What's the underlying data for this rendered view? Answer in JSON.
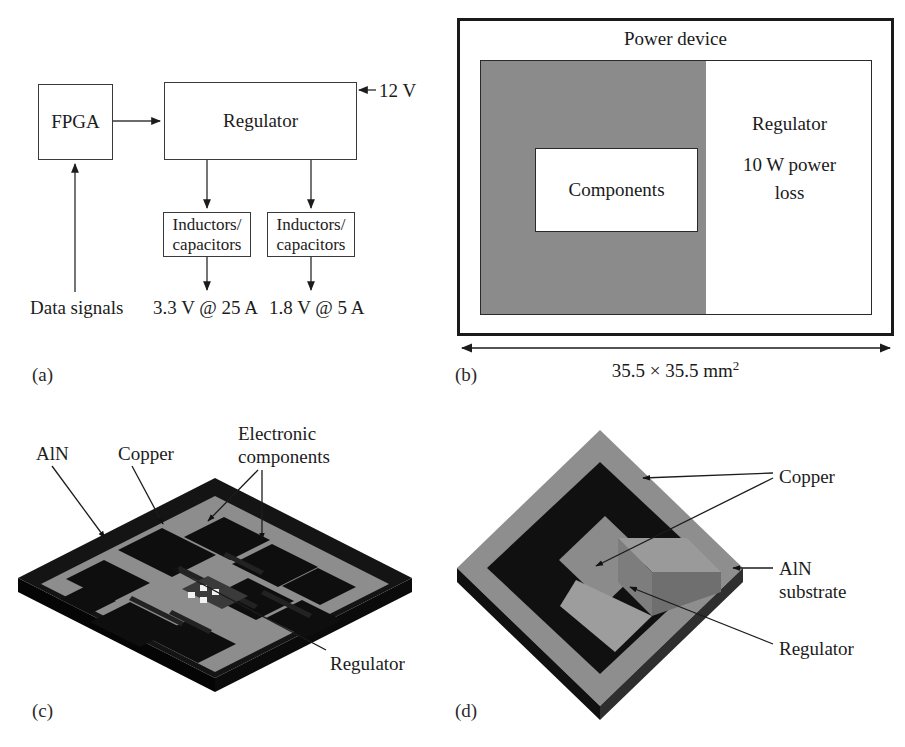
{
  "figure": {
    "panels": [
      {
        "tag": "(a)",
        "name": "block-diagram"
      },
      {
        "tag": "(b)",
        "name": "floorplan"
      },
      {
        "tag": "(c)",
        "name": "pcb-isometric"
      },
      {
        "tag": "(d)",
        "name": "substrate-isometric"
      }
    ]
  },
  "panel_a": {
    "tag": "(a)",
    "blocks": {
      "fpga": "FPGA",
      "regulator": "Regulator",
      "inductors_left": "Inductors/\ncapacitors",
      "inductors_right": "Inductors/\ncapacitors"
    },
    "block_lines": {
      "inductors_line1": "Inductors/",
      "inductors_line2": "capacitors"
    },
    "labels": {
      "input_voltage": "12 V",
      "data_signals": "Data signals",
      "output_left": "3.3 V @ 25 A",
      "output_right": "1.8 V @ 5 A"
    }
  },
  "panel_b": {
    "tag": "(b)",
    "title": "Power device",
    "components": "Components",
    "regulator_line1": "Regulator",
    "regulator_line2": "10 W power",
    "regulator_line3": "loss",
    "dimension_prefix": "35.5 × 35.5 mm",
    "dimension_exponent": "2",
    "gray_fill": "#8b8b8b"
  },
  "panel_c": {
    "tag": "(c)",
    "labels": {
      "aln": "AlN",
      "copper": "Copper",
      "electronic_components_line1": "Electronic",
      "electronic_components_line2": "components",
      "regulator": "Regulator"
    },
    "colors": {
      "board_dark": "#141414",
      "copper": "#8d8d8d",
      "pad_black": "#0d0d0d",
      "edge": "#2b2b2b"
    }
  },
  "panel_d": {
    "tag": "(d)",
    "labels": {
      "copper": "Copper",
      "aln_line1": "AlN",
      "aln_line2": "substrate",
      "regulator": "Regulator"
    },
    "colors": {
      "copper": "#8e8e8e",
      "aln_black": "#101010",
      "regulator_gray": "#9a9a9a",
      "side_dark": "#3a3a3a"
    }
  }
}
